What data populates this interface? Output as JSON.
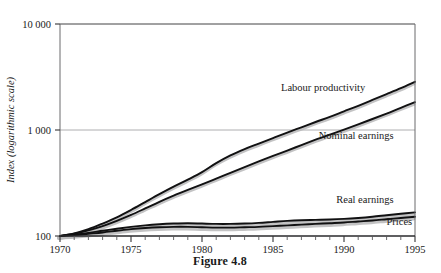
{
  "figure": {
    "caption": "Figure 4.8"
  },
  "chart_data": {
    "type": "line",
    "title": "",
    "xlabel": "",
    "ylabel": "Index (logarithmic scale)",
    "yscale": "log",
    "ylim": [
      100,
      10000
    ],
    "xlim": [
      1970,
      1995
    ],
    "grid": true,
    "legend_position": "inline-right",
    "y_ticks": [
      100,
      1000,
      10000
    ],
    "y_tick_labels": [
      "100",
      "1 000",
      "10 000"
    ],
    "x_ticks": [
      1970,
      1975,
      1980,
      1985,
      1990,
      1995
    ],
    "x_tick_labels": [
      "1970",
      "1975",
      "1980",
      "1985",
      "1990",
      "1995"
    ],
    "x_minor_tick_interval": 1,
    "x": [
      1970,
      1971,
      1972,
      1973,
      1974,
      1975,
      1976,
      1977,
      1978,
      1979,
      1980,
      1981,
      1982,
      1983,
      1984,
      1985,
      1986,
      1987,
      1988,
      1989,
      1990,
      1991,
      1992,
      1993,
      1994,
      1995
    ],
    "series": [
      {
        "name": "Labour productivity",
        "label": "Labour productivity",
        "color": "#111112",
        "values": [
          100,
          106,
          116,
          131,
          150,
          176,
          209,
          248,
          292,
          340,
          400,
          487,
          576,
          661,
          745,
          840,
          945,
          1060,
          1190,
          1330,
          1500,
          1690,
          1920,
          2180,
          2480,
          2850
        ]
      },
      {
        "name": "Nominal earnings",
        "label": "Nominal earnings",
        "color": "#111112",
        "values": [
          100,
          105,
          113,
          124,
          139,
          158,
          182,
          210,
          240,
          272,
          307,
          348,
          395,
          447,
          505,
          570,
          640,
          720,
          810,
          905,
          1010,
          1130,
          1270,
          1430,
          1620,
          1830
        ]
      },
      {
        "name": "Real earnings",
        "label": "Real earnings",
        "color": "#111112",
        "values": [
          100,
          103,
          107,
          112,
          117,
          122,
          126,
          129,
          131,
          132,
          131,
          130,
          130,
          131,
          133,
          136,
          139,
          141,
          142,
          143,
          145,
          148,
          152,
          157,
          162,
          167
        ]
      },
      {
        "name": "Prices",
        "label": "Prices",
        "color": "#111112",
        "values": [
          100,
          102,
          105,
          108,
          112,
          116,
          119,
          121,
          122,
          122,
          121,
          120,
          120,
          121,
          122,
          124,
          126,
          128,
          130,
          132,
          134,
          137,
          140,
          144,
          148,
          152
        ]
      }
    ],
    "annotations": [
      {
        "text": "Labour productivity",
        "x": 1991.5,
        "y": 2350
      },
      {
        "text": "Nominal earnings",
        "x": 1993.5,
        "y": 820
      },
      {
        "text": "Real earnings",
        "x": 1993.5,
        "y": 205
      },
      {
        "text": "Prices",
        "x": 1994.8,
        "y": 128
      }
    ]
  }
}
